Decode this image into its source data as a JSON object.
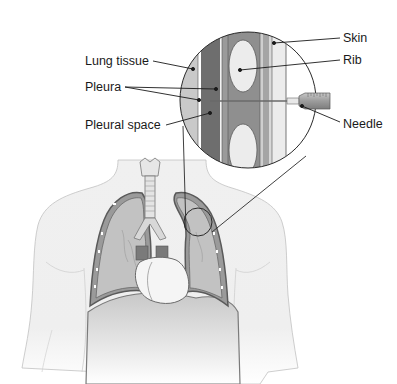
{
  "diagram": {
    "type": "anatomical illustration",
    "labels_left": [
      {
        "id": "lung-tissue",
        "text": "Lung tissue"
      },
      {
        "id": "pleura",
        "text": "Pleura"
      },
      {
        "id": "pleural-space",
        "text": "Pleural space"
      }
    ],
    "labels_right": [
      {
        "id": "skin",
        "text": "Skin"
      },
      {
        "id": "rib",
        "text": "Rib"
      },
      {
        "id": "needle",
        "text": "Needle"
      }
    ],
    "colors": {
      "outline": "#2a2a2a",
      "lung_fill": "#b8b8b8",
      "lung_tissue_light": "#c9c9c9",
      "pleural_space_dark": "#6e6e6e",
      "muscle": "#8f8f8f",
      "rib": "#ececec",
      "skin": "#e6e6e6",
      "body_fill": "#eeeeee",
      "heart": "#f4f4f4",
      "syringe": "#a8a8a8"
    }
  }
}
